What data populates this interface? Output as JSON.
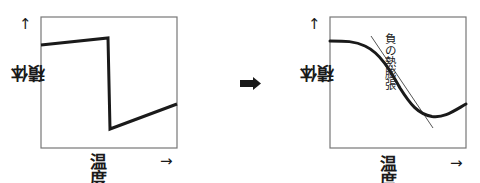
{
  "colors": {
    "line": "#1a1a1a",
    "tangent": "#555555",
    "frame": "#777777",
    "background": "#ffffff"
  },
  "left_panel": {
    "y_axis_label": "体積",
    "x_axis_label": "温度",
    "y_arrow": "↑",
    "x_arrow": "→"
  },
  "transition_arrow": {
    "icon": "right-arrow-icon",
    "glyph": "➡"
  },
  "right_panel": {
    "y_axis_label": "体積",
    "x_axis_label": "温度",
    "y_arrow": "↑",
    "x_arrow": "→",
    "annotation": "負の熱膨張"
  }
}
